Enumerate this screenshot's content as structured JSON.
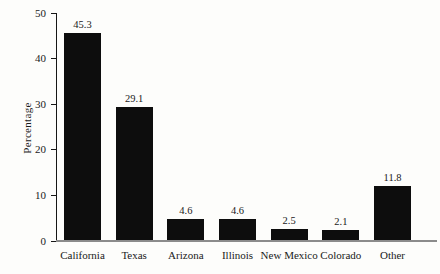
{
  "chart_data": {
    "type": "bar",
    "categories": [
      "California",
      "Texas",
      "Arizona",
      "Illinois",
      "New Mexico",
      "Colorado",
      "Other"
    ],
    "values": [
      45.3,
      29.1,
      4.6,
      4.6,
      2.5,
      2.1,
      11.8
    ],
    "value_labels": [
      "45.3",
      "29.1",
      "4.6",
      "4.6",
      "2.5",
      "2.1",
      "11.8"
    ],
    "title": "",
    "xlabel": "",
    "ylabel": "Percentage",
    "ylim": [
      0,
      50
    ],
    "yticks": [
      0,
      10,
      20,
      30,
      40,
      50
    ],
    "grid": false,
    "legend_position": "none",
    "bar_color": "#0d0d0d",
    "y_axis_color": "#161616",
    "baseline_color": "#8b8b8b",
    "background_color": "#fdfdfb"
  }
}
